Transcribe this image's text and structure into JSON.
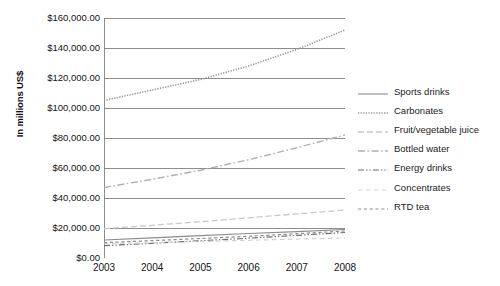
{
  "chart_data": {
    "type": "line",
    "title": "",
    "xlabel": "",
    "ylabel": "In millions US$",
    "grid": true,
    "legend_position": "right",
    "x": [
      2003,
      2004,
      2005,
      2006,
      2007,
      2008
    ],
    "categories": [
      "2003",
      "2004",
      "2005",
      "2006",
      "2007",
      "2008"
    ],
    "xlim": [
      2003,
      2008
    ],
    "ylim": [
      0,
      160000
    ],
    "ytick_labels": [
      "$0.00",
      "$20,000.00",
      "$40,000.00",
      "$60,000.00",
      "$80,000.00",
      "$100,000.00",
      "$120,000.00",
      "$140,000.00",
      "$160,000.00"
    ],
    "ytick_values": [
      0,
      20000,
      40000,
      60000,
      80000,
      100000,
      120000,
      140000,
      160000
    ],
    "series": [
      {
        "name": "Sports drinks",
        "dash": "solid",
        "color": "#8c8c8c",
        "width": 1.1,
        "values": [
          12000,
          13400,
          14900,
          16300,
          17600,
          19000
        ]
      },
      {
        "name": "Carbonates",
        "dash": "dotted",
        "color": "#9a9a9a",
        "width": 1.6,
        "values": [
          105000,
          112000,
          119000,
          128000,
          139000,
          152000
        ]
      },
      {
        "name": "Fruit/vegetable juice",
        "dash": "long-dash",
        "color": "#c9c9c9",
        "width": 1.3,
        "values": [
          19500,
          21800,
          24200,
          26800,
          29400,
          32000
        ]
      },
      {
        "name": "Bottled water",
        "dash": "dash-dot",
        "color": "#b0b0b0",
        "width": 1.4,
        "values": [
          47000,
          52500,
          58500,
          65500,
          73500,
          82000
        ]
      },
      {
        "name": "Energy drinks",
        "dash": "dash-dot-dot",
        "color": "#6f6f6f",
        "width": 1.2,
        "values": [
          8200,
          9800,
          11500,
          13200,
          15100,
          17000
        ]
      },
      {
        "name": "Concentrates",
        "dash": "sparse-dash",
        "color": "#d2d2d2",
        "width": 1.2,
        "values": [
          9500,
          10200,
          11000,
          11800,
          12600,
          13400
        ]
      },
      {
        "name": "RTD tea",
        "dash": "dash-gap-dash",
        "color": "#8f8f8f",
        "width": 1.2,
        "values": [
          10200,
          11600,
          13000,
          14500,
          16200,
          18000
        ]
      }
    ]
  },
  "legend": {
    "items": [
      {
        "label": "Sports drinks"
      },
      {
        "label": "Carbonates"
      },
      {
        "label": "Fruit/vegetable juice"
      },
      {
        "label": "Bottled water"
      },
      {
        "label": "Energy drinks"
      },
      {
        "label": "Concentrates"
      },
      {
        "label": "RTD tea"
      }
    ]
  }
}
